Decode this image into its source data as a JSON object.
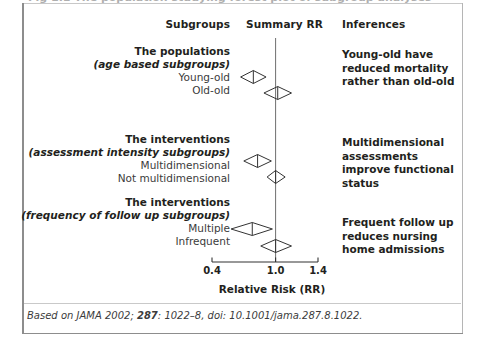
{
  "figure": {
    "clipped_caption": "Fig 1.1 The population studying forest plot of subgroup analyses",
    "headers": {
      "subgroups": "Subgroups",
      "summary_rr": "Summary RR",
      "inferences": "Inferences"
    },
    "footer": {
      "prefix": "Based on JAMA 2002; ",
      "volume": "287",
      "suffix": ": 1022–8, doi: 10.1001/jama.287.8.1022."
    }
  },
  "chart_data": {
    "type": "forest",
    "title": "Summary RR",
    "xlabel": "Relative Risk (RR)",
    "ylabel": "",
    "xlim": [
      0.4,
      1.4
    ],
    "xticks": [
      0.4,
      1.0,
      1.4
    ],
    "xtick_labels": [
      "0.4",
      "1.0",
      "1.4"
    ],
    "reference_line": 1.0,
    "grid": false,
    "legend": "none",
    "groups": [
      {
        "title": "The populations",
        "subtitle": "(age based subgroups)",
        "inference": "Young-old have reduced mortality rather than old-old",
        "rows": [
          {
            "label": "Young-old",
            "estimate": 0.79,
            "ci_low": 0.67,
            "ci_high": 0.91
          },
          {
            "label": "Old-old",
            "estimate": 1.02,
            "ci_low": 0.89,
            "ci_high": 1.15
          }
        ]
      },
      {
        "title": "The interventions",
        "subtitle": "(assessment intensity subgroups)",
        "inference": "Multidimensional assessments improve functional status",
        "rows": [
          {
            "label": "Multidimensional",
            "estimate": 0.83,
            "ci_low": 0.7,
            "ci_high": 0.96
          },
          {
            "label": "Not multidimensional",
            "estimate": 1.0,
            "ci_low": 0.92,
            "ci_high": 1.09
          }
        ]
      },
      {
        "title": "The interventions",
        "subtitle": "(frequency of follow up subgroups)",
        "inference": "Frequent follow up reduces nursing home admissions",
        "rows": [
          {
            "label": "Multiple",
            "estimate": 0.78,
            "ci_low": 0.58,
            "ci_high": 0.97
          },
          {
            "label": "Infrequent",
            "estimate": 1.0,
            "ci_low": 0.86,
            "ci_high": 1.15
          }
        ]
      }
    ]
  },
  "colors": {
    "marker_stroke": "#333333",
    "axis": "#333333",
    "reference_line": "#6f6f6f",
    "text": "#231f20",
    "frame": "#8d8d8d"
  }
}
